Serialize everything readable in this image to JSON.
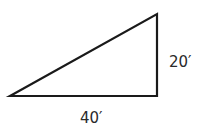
{
  "diagram": {
    "type": "right-triangle",
    "stroke_color": "#1a1a1a",
    "vertices": {
      "left": [
        10,
        96
      ],
      "top_right": [
        157,
        14
      ],
      "bottom_right": [
        157,
        96
      ]
    },
    "labels": {
      "vertical_side": "20′",
      "horizontal_side": "40′"
    }
  }
}
